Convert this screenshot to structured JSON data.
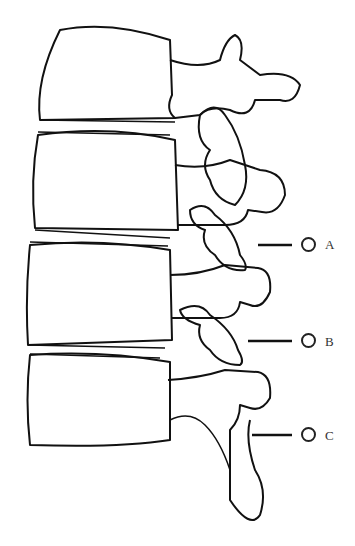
{
  "figure": {
    "labels": [
      {
        "id": "A",
        "text": "A",
        "y": 245
      },
      {
        "id": "B",
        "text": "B",
        "y": 341
      },
      {
        "id": "C",
        "text": "C",
        "y": 435
      }
    ]
  }
}
